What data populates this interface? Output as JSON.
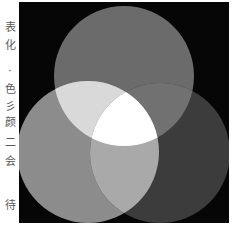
{
  "side_text": {
    "chars": [
      {
        "char": "表",
        "top": 22
      },
      {
        "char": "化",
        "top": 40
      },
      {
        "char": "·",
        "top": 66
      },
      {
        "char": "色",
        "top": 84
      },
      {
        "char": "彡",
        "top": 101
      },
      {
        "char": "颜",
        "top": 117
      },
      {
        "char": "二",
        "top": 137
      },
      {
        "char": "会",
        "top": 156
      },
      {
        "char": "待",
        "top": 200
      }
    ]
  },
  "figure": {
    "background": "#060606",
    "circles": [
      {
        "name": "top",
        "cx": 105,
        "cy": 74,
        "r": 70,
        "color": "#6b6b6b"
      },
      {
        "name": "bottom-left",
        "cx": 69,
        "cy": 150,
        "r": 71,
        "color": "#8c8c8c"
      },
      {
        "name": "bottom-right",
        "cx": 141,
        "cy": 151,
        "r": 70,
        "color": "#3c3c3c"
      }
    ],
    "overlaps": {
      "top_bottom_left": "#d9d9d9",
      "top_bottom_right": "#717171",
      "bottom_left_bottom_right": "#a9a9a9",
      "center": "#ffffff"
    }
  }
}
